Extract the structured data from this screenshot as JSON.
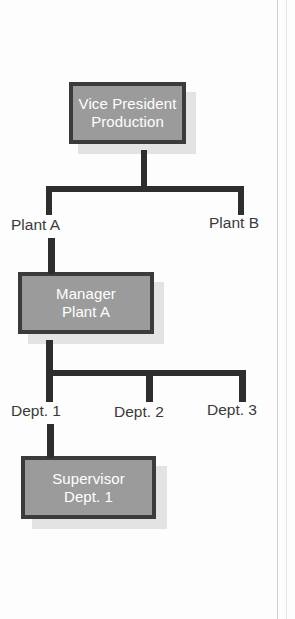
{
  "diagram": {
    "colors": {
      "box_fill": "#9b9b9b",
      "box_border": "#3b3b3b",
      "box_text": "#ffffff",
      "connector": "#2e2e2e",
      "label_text": "#3a3a3a",
      "shadow": "#e3e3e3",
      "background": "#fdfdfd"
    },
    "nodes": [
      {
        "id": "vice-president-production",
        "line1": "Vice President",
        "line2": "Production",
        "level": 1
      },
      {
        "id": "manager-plant-a",
        "line1": "Manager",
        "line2": "Plant A",
        "level": 2
      },
      {
        "id": "supervisor-dept-1",
        "line1": "Supervisor",
        "line2": "Dept. 1",
        "level": 3
      }
    ],
    "branch_labels": [
      {
        "id": "plant-a",
        "text": "Plant A"
      },
      {
        "id": "plant-b",
        "text": "Plant B"
      },
      {
        "id": "dept-1",
        "text": "Dept. 1"
      },
      {
        "id": "dept-2",
        "text": "Dept. 2"
      },
      {
        "id": "dept-3",
        "text": "Dept. 3"
      }
    ]
  }
}
